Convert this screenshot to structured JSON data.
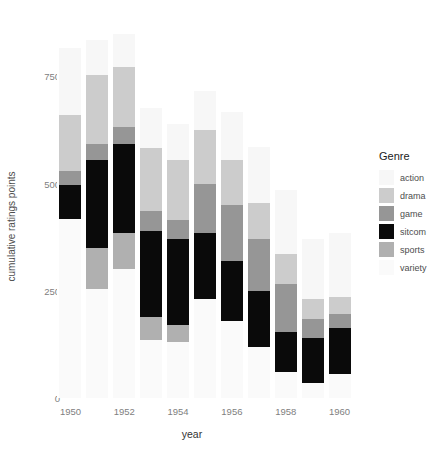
{
  "chart_data": {
    "type": "bar",
    "subtype": "stacked-bar",
    "title": "",
    "xlabel": "year",
    "ylabel": "cumulative ratings points",
    "categories": [
      1950,
      1951,
      1952,
      1953,
      1954,
      1955,
      1956,
      1957,
      1958,
      1959,
      1960
    ],
    "xtick_labels": [
      "1950",
      "1952",
      "1954",
      "1956",
      "1958",
      "1960"
    ],
    "xtick_values": [
      1950,
      1952,
      1954,
      1956,
      1958,
      1960
    ],
    "ytick_labels": [
      "0",
      "250",
      "500",
      "750"
    ],
    "ytick_values": [
      0,
      250,
      500,
      750
    ],
    "ylim": [
      0,
      900
    ],
    "xlim": [
      1949.5,
      1960.5
    ],
    "grid": false,
    "legend_title": "Genre",
    "legend_position": "right",
    "stack_order_bottom_to_top": [
      "variety",
      "sports",
      "sitcom",
      "game",
      "drama",
      "action"
    ],
    "series": [
      {
        "name": "action",
        "color": "#f7f7f7",
        "values": [
          158,
          82,
          75,
          95,
          85,
          90,
          112,
          130,
          150,
          140,
          150
        ]
      },
      {
        "name": "drama",
        "color": "#cccccc",
        "values": [
          130,
          160,
          140,
          145,
          140,
          125,
          105,
          85,
          70,
          45,
          40
        ]
      },
      {
        "name": "game",
        "color": "#969696",
        "values": [
          33,
          38,
          40,
          47,
          45,
          115,
          130,
          120,
          110,
          45,
          33
        ]
      },
      {
        "name": "sitcom",
        "color": "#0a0a0a",
        "values": [
          78,
          205,
          208,
          200,
          200,
          155,
          140,
          130,
          95,
          105,
          108
        ]
      },
      {
        "name": "sports",
        "color": "#b0b0b0",
        "values": [
          0,
          95,
          85,
          55,
          40,
          0,
          0,
          0,
          0,
          0,
          0
        ]
      },
      {
        "name": "variety",
        "color": "#fafafa",
        "values": [
          418,
          255,
          300,
          135,
          130,
          230,
          180,
          120,
          60,
          35,
          55
        ]
      }
    ],
    "totals": [
      817,
      835,
      848,
      677,
      640,
      715,
      667,
      585,
      485,
      370,
      386
    ]
  },
  "legend": {
    "title": "Genre",
    "items": [
      {
        "label": "action",
        "color": "#f7f7f7"
      },
      {
        "label": "drama",
        "color": "#cccccc"
      },
      {
        "label": "game",
        "color": "#969696"
      },
      {
        "label": "sitcom",
        "color": "#0a0a0a"
      },
      {
        "label": "sports",
        "color": "#b0b0b0"
      },
      {
        "label": "variety",
        "color": "#fafafa"
      }
    ]
  },
  "axes": {
    "y_title": "cumulative ratings points",
    "x_title": "year"
  },
  "colors": {
    "panel_background": "#ffffff",
    "page_background": "#ffffff",
    "tick_text": "#808080",
    "axis_title_text": "#333333"
  }
}
